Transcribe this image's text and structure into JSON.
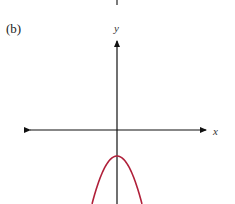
{
  "figure": {
    "panel_label": "(b)"
  },
  "chart_data": {
    "type": "line",
    "title": "",
    "panel_label": "(b)",
    "xlabel": "x",
    "ylabel": "y",
    "grid": false,
    "ticks": false,
    "xlim": [
      -4.5,
      4.5
    ],
    "ylim": [
      -2.85,
      5.0
    ],
    "series": [
      {
        "name": "parabola",
        "description": "downward-opening parabola with vertex on the negative y-axis",
        "equation": "y = -2x^2 - 1",
        "vertex": [
          0,
          -1
        ],
        "color": "#b0203a",
        "x": [
          -0.96,
          -0.8,
          -0.6,
          -0.4,
          -0.2,
          0,
          0.2,
          0.4,
          0.6,
          0.8,
          0.96
        ],
        "y": [
          -2.84,
          -2.28,
          -1.72,
          -1.32,
          -1.08,
          -1.0,
          -1.08,
          -1.32,
          -1.72,
          -2.28,
          -2.84
        ]
      }
    ],
    "top_fragment": "axis arrow tail from previous panel"
  }
}
